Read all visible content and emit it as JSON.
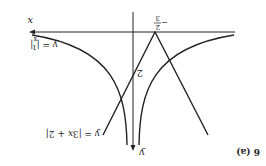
{
  "figure": {
    "label": "6 (a)",
    "rotation_degrees": 180,
    "axes": {
      "x_label": "x",
      "y_label": "y"
    },
    "curves": [
      {
        "name": "reciprocal-abs",
        "equation": "y = |1/x|"
      },
      {
        "name": "abs-linear",
        "equation": "y = |3x + 2|"
      }
    ],
    "annotations": {
      "x_intercept": "-2/3",
      "x_intercept_num": "2",
      "x_intercept_den": "3",
      "y_intercept": "2"
    },
    "colors": {
      "ink": "#222222",
      "background": "#ffffff"
    }
  }
}
